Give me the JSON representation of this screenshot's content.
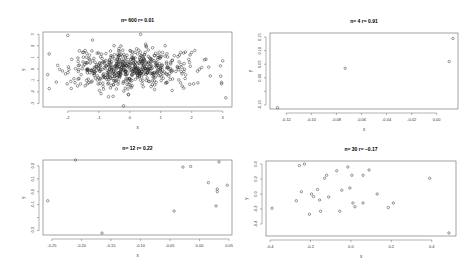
{
  "chart_data": [
    {
      "type": "scatter",
      "title": "n= 600  r= 0.01",
      "xlabel": "x",
      "ylabel": "y",
      "xlim": [
        -2.8,
        3.3
      ],
      "ylim": [
        -3.3,
        3.2
      ],
      "xticks": [
        -2,
        -1,
        0,
        1,
        2,
        3
      ],
      "yticks": [
        -3,
        -2,
        -1,
        0,
        1,
        2,
        3
      ],
      "grid": false,
      "n": 600,
      "r": 0.01,
      "generated": {
        "seed": 7,
        "count": 600,
        "mean": [
          0,
          0
        ],
        "sd": [
          1,
          1
        ]
      },
      "points": [
        [
          -2.0,
          2.9
        ],
        [
          -1.2,
          2.5
        ],
        [
          0.35,
          3.0
        ],
        [
          3.1,
          -2.5
        ],
        [
          -0.2,
          -3.2
        ],
        [
          2.6,
          -0.6
        ],
        [
          3.0,
          0.7
        ],
        [
          -2.6,
          -1.7
        ],
        [
          -2.6,
          1.3
        ],
        [
          2.1,
          1.6
        ]
      ]
    },
    {
      "type": "scatter",
      "title": "n= 4  r= 0.91",
      "xlabel": "x",
      "ylabel": "y",
      "xlim": [
        -0.133,
        0.017
      ],
      "ylim": [
        -0.115,
        0.165
      ],
      "xticks": [
        -0.12,
        -0.1,
        -0.08,
        -0.06,
        -0.04,
        -0.02,
        0.0
      ],
      "xtick_labels": [
        "-0.12",
        "-0.10",
        "-0.08",
        "-0.06",
        "-0.04",
        "-0.02",
        "0.00"
      ],
      "yticks": [
        -0.1,
        -0.05,
        0.0,
        0.05,
        0.1,
        0.15
      ],
      "ytick_labels": [
        "-0.10",
        "",
        "0.00",
        "0.05",
        "0.10",
        "0.15"
      ],
      "grid": false,
      "n": 4,
      "r": 0.91,
      "points": [
        [
          -0.127,
          -0.11
        ],
        [
          -0.073,
          0.035
        ],
        [
          0.01,
          0.06
        ],
        [
          0.013,
          0.145
        ]
      ]
    },
    {
      "type": "scatter",
      "title": "n= 12  r= 0.22",
      "xlabel": "x",
      "ylabel": "y",
      "xlim": [
        -0.265,
        0.055
      ],
      "ylim": [
        -0.335,
        0.245
      ],
      "xticks": [
        -0.25,
        -0.2,
        -0.15,
        -0.1,
        -0.05,
        0.0,
        0.05
      ],
      "xtick_labels": [
        "-0.25",
        "-0.20",
        "-0.15",
        "-0.10",
        "-0.05",
        "0.00",
        "0.05"
      ],
      "yticks": [
        -0.3,
        -0.2,
        -0.1,
        0.0,
        0.1,
        0.2
      ],
      "ytick_labels": [
        "-0.3",
        "",
        "-0.1",
        "0.0",
        "0.1",
        "0.2"
      ],
      "grid": false,
      "n": 12,
      "r": 0.22,
      "points": [
        [
          -0.257,
          -0.07
        ],
        [
          -0.21,
          0.245
        ],
        [
          -0.165,
          -0.32
        ],
        [
          -0.043,
          -0.15
        ],
        [
          -0.028,
          0.19
        ],
        [
          -0.015,
          0.195
        ],
        [
          0.015,
          0.07
        ],
        [
          0.028,
          -0.11
        ],
        [
          0.03,
          0.0
        ],
        [
          0.03,
          0.02
        ],
        [
          0.033,
          0.23
        ],
        [
          0.047,
          0.05
        ]
      ]
    },
    {
      "type": "scatter",
      "title": "n= 30  r= −0.17",
      "xlabel": "x",
      "ylabel": "y",
      "xlim": [
        -0.42,
        0.52
      ],
      "ylim": [
        -0.56,
        0.44
      ],
      "xticks": [
        -0.4,
        -0.2,
        0.0,
        0.2,
        0.4
      ],
      "xtick_labels": [
        "-0.4",
        "-0.2",
        "0.0",
        "0.2",
        "0.4"
      ],
      "yticks": [
        -0.4,
        -0.2,
        0.0,
        0.2,
        0.4
      ],
      "ytick_labels": [
        "-0.4",
        "-0.2",
        "0.0",
        "0.2",
        "0.4"
      ],
      "grid": false,
      "n": 30,
      "r": -0.17,
      "points": [
        [
          -0.39,
          -0.19
        ],
        [
          -0.27,
          -0.09
        ],
        [
          -0.255,
          0.38
        ],
        [
          -0.245,
          0.03
        ],
        [
          -0.23,
          0.4
        ],
        [
          -0.205,
          -0.27
        ],
        [
          -0.195,
          0.0
        ],
        [
          -0.185,
          -0.035
        ],
        [
          -0.165,
          0.06
        ],
        [
          -0.155,
          -0.08
        ],
        [
          -0.15,
          -0.23
        ],
        [
          -0.13,
          0.21
        ],
        [
          -0.12,
          0.25
        ],
        [
          -0.11,
          -0.04
        ],
        [
          -0.07,
          0.31
        ],
        [
          -0.055,
          -0.23
        ],
        [
          -0.045,
          0.05
        ],
        [
          -0.015,
          0.36
        ],
        [
          -0.005,
          0.08
        ],
        [
          0.005,
          0.25
        ],
        [
          0.01,
          -0.12
        ],
        [
          0.02,
          -0.17
        ],
        [
          0.06,
          0.25
        ],
        [
          0.06,
          -0.12
        ],
        [
          0.09,
          0.32
        ],
        [
          0.13,
          0.0
        ],
        [
          0.185,
          -0.18
        ],
        [
          0.21,
          -0.12
        ],
        [
          0.39,
          0.21
        ],
        [
          0.485,
          -0.52
        ]
      ]
    }
  ],
  "panels_layout": [
    {
      "x": 0,
      "y": 0,
      "w": 237,
      "h": 136,
      "box": [
        43,
        32,
        232,
        107
      ]
    },
    {
      "x": 237,
      "y": 0,
      "w": 237,
      "h": 136,
      "box": [
        33,
        33,
        221,
        109
      ]
    },
    {
      "x": 0,
      "y": 136,
      "w": 237,
      "h": 136,
      "box": [
        43,
        24,
        232,
        99
      ]
    },
    {
      "x": 237,
      "y": 136,
      "w": 237,
      "h": 136,
      "box": [
        29,
        25,
        219,
        100
      ]
    }
  ]
}
